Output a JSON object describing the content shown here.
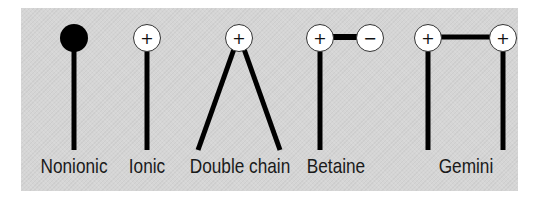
{
  "figure": {
    "background_color": "#d5d5d5",
    "line_color": "#000000",
    "headgroup_fill": "#ffffff",
    "surfactants": [
      {
        "name": "Nonionic",
        "headgroups": [
          {
            "symbol": "",
            "fill": "#000000"
          }
        ],
        "tails": 1
      },
      {
        "name": "Ionic",
        "headgroups": [
          {
            "symbol": "+",
            "fill": "#ffffff"
          }
        ],
        "tails": 1
      },
      {
        "name": "Double chain",
        "headgroups": [
          {
            "symbol": "+",
            "fill": "#ffffff"
          }
        ],
        "tails": 2
      },
      {
        "name": "Betaine",
        "headgroups": [
          {
            "symbol": "+",
            "fill": "#ffffff"
          },
          {
            "symbol": "−",
            "fill": "#ffffff"
          }
        ],
        "tails": 1
      },
      {
        "name": "Gemini",
        "headgroups": [
          {
            "symbol": "+",
            "fill": "#ffffff"
          },
          {
            "symbol": "+",
            "fill": "#ffffff"
          }
        ],
        "tails": 2
      }
    ]
  },
  "labels": {
    "nonionic": "Nonionic",
    "ionic": "Ionic",
    "double_chain": "Double chain",
    "betaine": "Betaine",
    "gemini": "Gemini"
  },
  "symbols": {
    "plus": "+",
    "minus": "−"
  }
}
